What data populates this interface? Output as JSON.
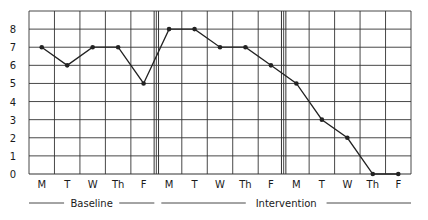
{
  "chart_data": {
    "type": "line",
    "title": "",
    "xlabel": "",
    "ylabel": "",
    "ylim": [
      0,
      9
    ],
    "y_ticks": [
      0,
      1,
      2,
      3,
      4,
      5,
      6,
      7,
      8
    ],
    "grid": true,
    "legend": "none",
    "categories": [
      "M",
      "T",
      "W",
      "Th",
      "F",
      "M",
      "T",
      "W",
      "Th",
      "F",
      "M",
      "T",
      "W",
      "Th",
      "F"
    ],
    "values": [
      7,
      6,
      7,
      7,
      5,
      8,
      8,
      7,
      7,
      6,
      5,
      3,
      2,
      0,
      0
    ],
    "phase_change_after_index": [
      4,
      9
    ],
    "phases": [
      {
        "label": "Baseline",
        "start_index": 0,
        "end_index": 4
      },
      {
        "label": "Intervention",
        "start_index": 5,
        "end_index": 14
      }
    ],
    "colors": {
      "line": "#222222",
      "grid": "#333333",
      "background": "#ffffff"
    }
  }
}
